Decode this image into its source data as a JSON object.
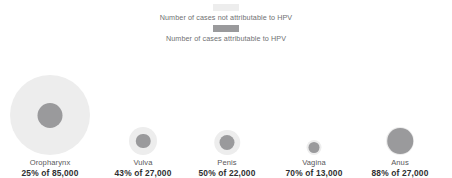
{
  "legend": {
    "items": [
      {
        "swatch_name": "legend-swatch-not-attributable",
        "label": "Number of cases not attributable to HPV",
        "color": "#ededed"
      },
      {
        "swatch_name": "legend-swatch-attributable",
        "label": "Number of cases attributable to HPV",
        "color": "#9a9a9c"
      }
    ]
  },
  "colors": {
    "not_attributable": "#ededed",
    "attributable": "#9a9a9c",
    "label_text": "#58585a",
    "stat_text": "#2f2f31",
    "legend_text": "#6f7072",
    "background": "#ffffff"
  },
  "chart_data": {
    "type": "bubble",
    "title": "",
    "subtitle": "",
    "xlabel": "",
    "ylabel": "",
    "legend_position": "top",
    "grid": false,
    "encoding": "Outer circle area is proportional to total annual cases; inner circle area is proportional to cases attributable to HPV",
    "categories": [
      "Oropharynx",
      "Vulva",
      "Penis",
      "Vagina",
      "Anus"
    ],
    "series": [
      {
        "name": "Number of cases not attributable to HPV",
        "values": [
          63750,
          15390,
          11000,
          3900,
          3240
        ]
      },
      {
        "name": "Number of cases attributable to HPV",
        "values": [
          21250,
          11610,
          11000,
          9100,
          23760
        ]
      }
    ],
    "points": [
      {
        "category": "Oropharynx",
        "percent": 25,
        "total": 85000,
        "total_label": "85,000",
        "percent_label": "25%",
        "stat": "25% of 85,000",
        "outer_diameter_px": 80,
        "inner_diameter_px": 25
      },
      {
        "category": "Vulva",
        "percent": 43,
        "total": 27000,
        "total_label": "27,000",
        "percent_label": "43%",
        "stat": "43% of 27,000",
        "outer_diameter_px": 28,
        "inner_diameter_px": 14.5
      },
      {
        "category": "Penis",
        "percent": 50,
        "total": 22000,
        "total_label": "22,000",
        "percent_label": "50%",
        "stat": "50% of 22,000",
        "outer_diameter_px": 25.5,
        "inner_diameter_px": 15
      },
      {
        "category": "Vagina",
        "percent": 70,
        "total": 13000,
        "total_label": "13,000",
        "percent_label": "70%",
        "stat": "70% of 13,000",
        "outer_diameter_px": 15,
        "inner_diameter_px": 11
      },
      {
        "category": "Anus",
        "percent": 88,
        "total": 27000,
        "total_label": "27,000",
        "percent_label": "88%",
        "stat": "88% of 27,000",
        "outer_diameter_px": 28,
        "inner_diameter_px": 25.5
      }
    ]
  },
  "bubbles": [
    {
      "name": "Oropharynx",
      "stat": "25% of 85,000"
    },
    {
      "name": "Vulva",
      "stat": "43% of 27,000"
    },
    {
      "name": "Penis",
      "stat": "50% of 22,000"
    },
    {
      "name": "Vagina",
      "stat": "70% of 13,000"
    },
    {
      "name": "Anus",
      "stat": "88% of 27,000"
    }
  ]
}
